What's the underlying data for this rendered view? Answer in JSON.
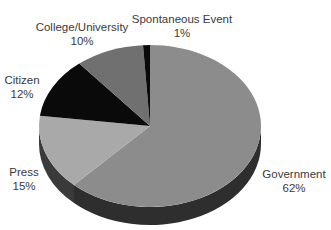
{
  "chart_data": {
    "type": "pie",
    "style": "3d",
    "title": "",
    "start_angle_deg": 0,
    "direction": "clockwise",
    "slices": [
      {
        "name": "Government",
        "value": 62,
        "label": "62%",
        "color": "#8c8c8c",
        "side_color": "#2e2e2e"
      },
      {
        "name": "Press",
        "value": 15,
        "label": "15%",
        "color": "#a9a9a9",
        "side_color": "#3a3a3a"
      },
      {
        "name": "Citizen",
        "value": 12,
        "label": "12%",
        "color": "#0a0a0a",
        "side_color": "#050505"
      },
      {
        "name": "College/University",
        "value": 10,
        "label": "10%",
        "color": "#707070",
        "side_color": "#2a2a2a"
      },
      {
        "name": "Spontaneous Event",
        "value": 1,
        "label": "1%",
        "color": "#0a0a0a",
        "side_color": "#050505"
      }
    ],
    "legend": "none (labels placed beside slices)"
  },
  "labels": {
    "government": {
      "name": "Government",
      "pct": "62%"
    },
    "press": {
      "name": "Press",
      "pct": "15%"
    },
    "citizen": {
      "name": "Citizen",
      "pct": "12%"
    },
    "college": {
      "name": "College/University",
      "pct": "10%"
    },
    "spontaneous": {
      "name": "Spontaneous Event",
      "pct": "1%"
    }
  }
}
